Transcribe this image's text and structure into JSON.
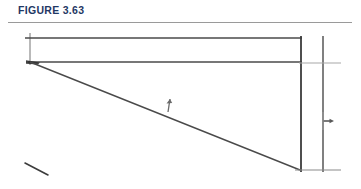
{
  "page": {
    "width": 361,
    "height": 189,
    "background_color": "#ffffff"
  },
  "figure_header": {
    "label": "FIGURE 3.63",
    "label_color": "#1f3864",
    "rule_color": "#9a9a9a"
  },
  "diagram": {
    "title": "FIGURE 3.63",
    "kind": "engineering-line-sketch",
    "ink_color": "#3c3c3c",
    "light_ink_color": "#a8a8a8",
    "elements": [
      {
        "name": "top-horizontal-member",
        "type": "line",
        "x1": 25,
        "y1": 38,
        "x2": 302,
        "y2": 38,
        "color": "#4a4a4a",
        "width": 1.6
      },
      {
        "name": "left-vertical-tick",
        "type": "line",
        "x1": 30,
        "y1": 33,
        "x2": 30,
        "y2": 65,
        "color": "#8a8a8a",
        "width": 1.2
      },
      {
        "name": "second-horizontal-member",
        "type": "line",
        "x1": 28,
        "y1": 62,
        "x2": 302,
        "y2": 62,
        "color": "#4a4a4a",
        "width": 1.6
      },
      {
        "name": "left-node-vertex",
        "type": "node",
        "x": 30,
        "y": 62,
        "color": "#2e2e2e"
      },
      {
        "name": "diagonal-member",
        "type": "line",
        "x1": 30,
        "y1": 62,
        "x2": 300,
        "y2": 170,
        "color": "#4a4a4a",
        "width": 1.5
      },
      {
        "name": "diagonal-load-arrow",
        "type": "arrow",
        "x": 168,
        "y": 106,
        "direction": "up",
        "color": "#6a6a6a"
      },
      {
        "name": "right-support-vertical-inner",
        "type": "line",
        "x1": 301,
        "y1": 36,
        "x2": 301,
        "y2": 172,
        "color": "#3c3c3c",
        "width": 1.8
      },
      {
        "name": "right-support-vertical-outer",
        "type": "line",
        "x1": 323,
        "y1": 36,
        "x2": 323,
        "y2": 172,
        "color": "#4a4a4a",
        "width": 1.4
      },
      {
        "name": "upper-dimension-line",
        "type": "line",
        "x1": 299,
        "y1": 63,
        "x2": 341,
        "y2": 63,
        "color": "#a8a8a8",
        "width": 1.1
      },
      {
        "name": "right-dimension-arrow",
        "type": "arrow",
        "x": 325,
        "y": 121,
        "direction": "right",
        "color": "#5a5a5a"
      },
      {
        "name": "bottom-dimension-line",
        "type": "line",
        "x1": 295,
        "y1": 170,
        "x2": 341,
        "y2": 170,
        "color": "#8a8a8a",
        "width": 1.2
      },
      {
        "name": "stray-pencil-stroke",
        "type": "line",
        "x1": 25,
        "y1": 163,
        "x2": 48,
        "y2": 175,
        "color": "#3c3c3c",
        "width": 1.6
      }
    ]
  }
}
